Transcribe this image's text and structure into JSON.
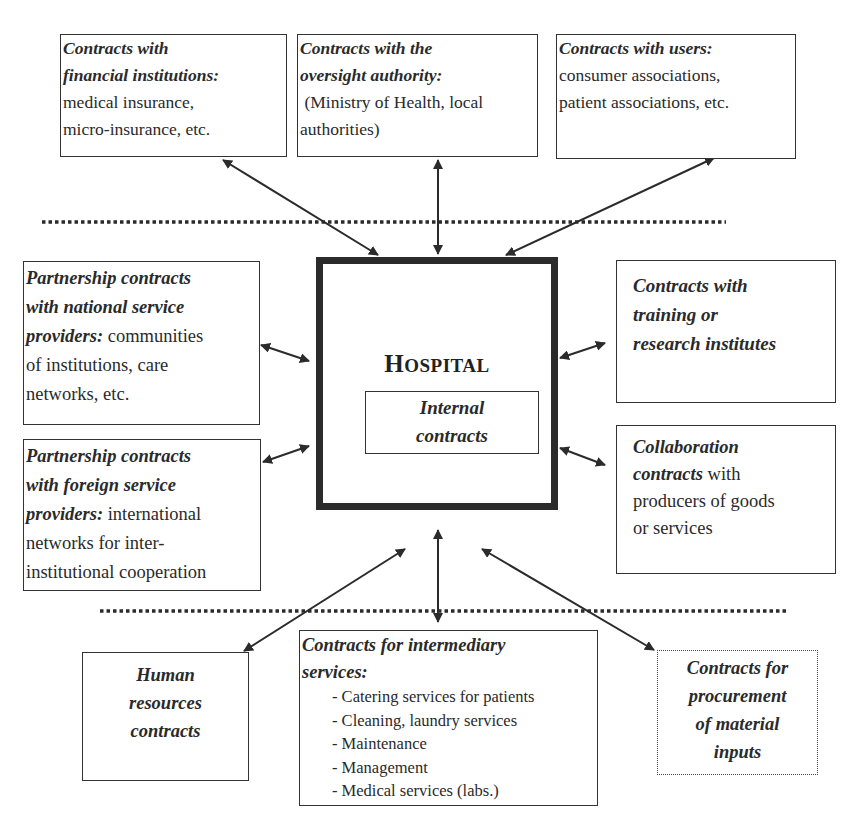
{
  "diagram": {
    "center": {
      "title_first": "H",
      "title_rest": "OSPITAL",
      "inner_line1": "Internal",
      "inner_line2": "contracts"
    },
    "top_boxes": [
      {
        "title_lines": [
          "Contracts with",
          "financial institutions:"
        ],
        "body_lines": [
          "medical insurance,",
          "micro-insurance, etc."
        ]
      },
      {
        "title_lines": [
          "Contracts with the",
          "oversight authority:"
        ],
        "body_lines": [
          " (Ministry of Health, local",
          "authorities)"
        ]
      },
      {
        "title_lines": [
          "Contracts with users:"
        ],
        "body_lines": [
          "consumer associations,",
          "patient associations, etc."
        ]
      }
    ],
    "left_boxes": [
      {
        "title_lines": [
          "Partnership contracts",
          "with national service",
          "providers:"
        ],
        "inline_body": " communities",
        "body_lines": [
          "of institutions, care",
          "networks, etc."
        ]
      },
      {
        "title_lines": [
          "Partnership contracts",
          "with foreign service",
          "providers:"
        ],
        "inline_body": " international",
        "body_lines": [
          "networks for inter-",
          "institutional cooperation"
        ]
      }
    ],
    "right_boxes": [
      {
        "title_lines": [
          "Contracts with",
          "training or",
          "research institutes"
        ]
      },
      {
        "title_lines": [
          "Collaboration",
          "contracts"
        ],
        "inline_body": " with",
        "body_lines": [
          "producers of goods",
          "or services"
        ]
      }
    ],
    "bottom_boxes": [
      {
        "title_lines": [
          "Human",
          "resources",
          "contracts"
        ]
      },
      {
        "title_lines": [
          "Contracts for intermediary",
          "services:"
        ],
        "list_items": [
          "- Catering services for patients",
          "- Cleaning, laundry services",
          "- Maintenance",
          "- Management",
          "- Medical services (labs.)"
        ]
      },
      {
        "title_lines": [
          "Contracts for",
          "procurement",
          "of material",
          "inputs"
        ],
        "border_style": "dotted"
      }
    ],
    "separators": [
      {
        "style": "dotted",
        "position": "upper"
      },
      {
        "style": "dotted",
        "position": "lower"
      }
    ],
    "colors": {
      "line": "#2b2b2b",
      "text": "#2a2a2a",
      "background": "#ffffff"
    }
  }
}
